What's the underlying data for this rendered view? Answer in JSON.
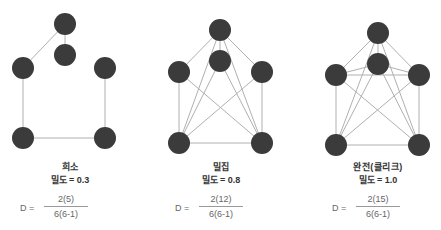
{
  "colors": {
    "node": "#3b3b3b",
    "edge": "#b0b0b0",
    "text": "#333333",
    "formula": "#666666"
  },
  "graphs": [
    {
      "title": "희소",
      "density_label": "밀도 = 0.3",
      "formula": {
        "lhs": "D =",
        "numerator": "2(5)",
        "denominator": "6(6-1)"
      },
      "nodes": [
        [
          65,
          24
        ],
        [
          65,
          55
        ],
        [
          23,
          68
        ],
        [
          105,
          68
        ],
        [
          23,
          138
        ],
        [
          105,
          138
        ]
      ],
      "edges": [
        [
          0,
          1
        ],
        [
          0,
          2
        ],
        [
          2,
          4
        ],
        [
          4,
          5
        ],
        [
          5,
          3
        ]
      ]
    },
    {
      "title": "밀집",
      "density_label": "밀도 = 0.8",
      "formula": {
        "lhs": "D =",
        "numerator": "2(12)",
        "denominator": "6(6-1)"
      },
      "nodes": [
        [
          220,
          30
        ],
        [
          220,
          61
        ],
        [
          179,
          72
        ],
        [
          262,
          72
        ],
        [
          179,
          143
        ],
        [
          262,
          143
        ]
      ],
      "edges": [
        [
          0,
          1
        ],
        [
          0,
          2
        ],
        [
          0,
          3
        ],
        [
          0,
          4
        ],
        [
          0,
          5
        ],
        [
          1,
          4
        ],
        [
          1,
          5
        ],
        [
          2,
          4
        ],
        [
          2,
          5
        ],
        [
          3,
          4
        ],
        [
          3,
          5
        ],
        [
          4,
          5
        ]
      ]
    },
    {
      "title": "완전(클리크)",
      "density_label": "밀도 = 1.0",
      "formula": {
        "lhs": "D =",
        "numerator": "2(15)",
        "denominator": "6(6-1)"
      },
      "nodes": [
        [
          378,
          33
        ],
        [
          378,
          64
        ],
        [
          336,
          75
        ],
        [
          419,
          75
        ],
        [
          336,
          145
        ],
        [
          419,
          145
        ]
      ],
      "edges": [
        [
          0,
          1
        ],
        [
          0,
          2
        ],
        [
          0,
          3
        ],
        [
          0,
          4
        ],
        [
          0,
          5
        ],
        [
          1,
          2
        ],
        [
          1,
          3
        ],
        [
          1,
          4
        ],
        [
          1,
          5
        ],
        [
          2,
          3
        ],
        [
          2,
          4
        ],
        [
          2,
          5
        ],
        [
          3,
          4
        ],
        [
          3,
          5
        ],
        [
          4,
          5
        ]
      ]
    }
  ]
}
